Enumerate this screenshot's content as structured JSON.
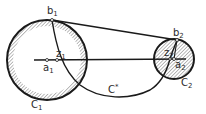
{
  "diagram": {
    "type": "geometry",
    "stroke_color": "#1a1a1a",
    "hatch_color": "#555555",
    "background": "#ffffff",
    "circles": [
      {
        "id": "C1",
        "label": "C",
        "label_sub": "1",
        "center_label": "a",
        "center_sub": "1"
      },
      {
        "id": "C2",
        "label": "C",
        "label_sub": "2",
        "center_label": "a",
        "center_sub": "2"
      }
    ],
    "points": [
      {
        "id": "b1",
        "label": "b",
        "sub": "1"
      },
      {
        "id": "b2",
        "label": "b",
        "sub": "2"
      },
      {
        "id": "z1",
        "label": "z",
        "sub": "1"
      },
      {
        "id": "z2",
        "label": "z",
        "sub": "2"
      }
    ],
    "curve": {
      "id": "C*",
      "label": "C",
      "sup": "*"
    }
  }
}
